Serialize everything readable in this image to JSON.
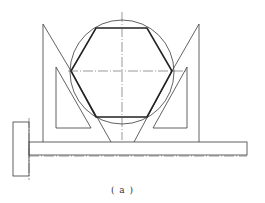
{
  "figure": {
    "caption": "( a )",
    "line_color": "#3a3a3a",
    "hexagon": {
      "vertices": [
        [
          96,
          28
        ],
        [
          147,
          28
        ],
        [
          172,
          71
        ],
        [
          147,
          117
        ],
        [
          96,
          117
        ],
        [
          71,
          71
        ]
      ]
    },
    "circle": {
      "cx": 122,
      "cy": 72,
      "r": 52
    },
    "shaft": {
      "x1": 29,
      "x2": 247,
      "y_top": 142,
      "y_bottom": 155
    },
    "head": {
      "x": 13,
      "y": 122,
      "w": 16,
      "h": 54
    }
  }
}
